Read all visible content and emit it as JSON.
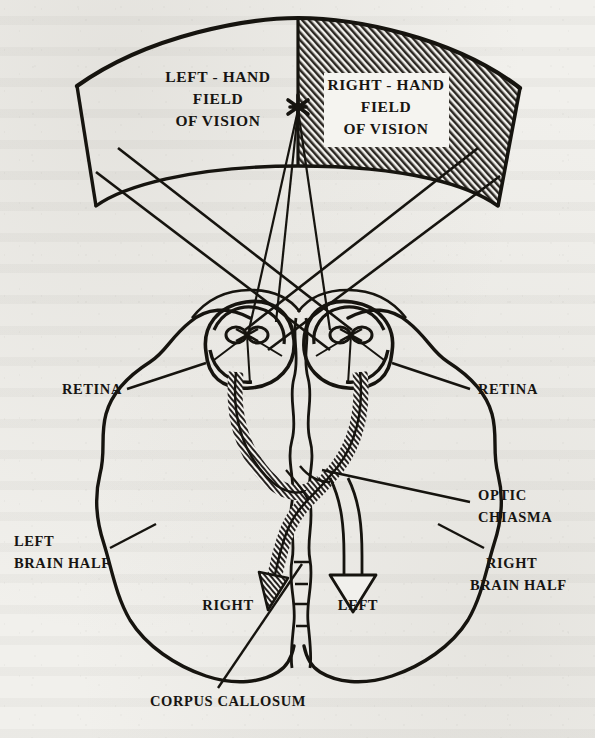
{
  "figure": {
    "type": "anatomical-diagram",
    "medium": "scanned book page, black ink line drawing on off-white paper"
  },
  "labels": {
    "left_field": "LEFT - HAND\nFIELD\nOF VISION",
    "left_field_line1": "LEFT - HAND",
    "left_field_line2": "FIELD",
    "left_field_line3": "OF VISION",
    "right_field_line1": "RIGHT - HAND",
    "right_field_line2": "FIELD",
    "right_field_line3": "OF VISION",
    "retina_left": "RETINA",
    "retina_right": "RETINA",
    "optic_chiasma_line1": "OPTIC",
    "optic_chiasma_line2": "CHIASMA",
    "left_brain_line1": "LEFT",
    "left_brain_line2": "BRAIN HALF",
    "right_brain_line1": "RIGHT",
    "right_brain_line2": "BRAIN HALF",
    "arrow_left_label": "RIGHT",
    "arrow_right_label": "LEFT",
    "corpus_callosum": "CORPUS CALLOSUM"
  },
  "markers": {
    "fixation_point": "✶"
  },
  "colors": {
    "ink": "#16140f",
    "paper": "#f1f0ec",
    "hatch_fill": "#2b2722",
    "label_box": "#f5f4f0"
  },
  "regions": {
    "right_field_shading": "diagonal-hatch",
    "left_field_shading": "none",
    "crossed_tract_shading": "diagonal-hatch",
    "uncrossed_tract_shading": "hollow"
  }
}
